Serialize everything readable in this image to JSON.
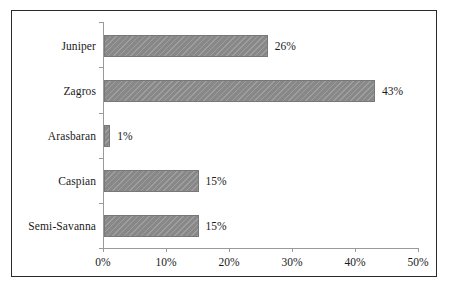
{
  "figure": {
    "background_color": "#ffffff",
    "frame_color": "#2a2a2a",
    "bar_color": "#8d8d8d",
    "axis_color": "#9a9a9a",
    "text_color": "#1a1a1a"
  },
  "chart_data": {
    "type": "bar",
    "orientation": "horizontal",
    "title": "",
    "subtitle": "",
    "xlabel": "",
    "ylabel": "",
    "categories": [
      "Juniper",
      "Zagros",
      "Arasbaran",
      "Caspian",
      "Semi-Savanna"
    ],
    "values": [
      26,
      43,
      1,
      15,
      15
    ],
    "data_labels": [
      "26%",
      "43%",
      "1%",
      "15%",
      "15%"
    ],
    "xlim": [
      0,
      50
    ],
    "xtick_values": [
      0,
      10,
      20,
      30,
      40,
      50
    ],
    "xtick_labels": [
      "0%",
      "10%",
      "20%",
      "30%",
      "40%",
      "50%"
    ],
    "grid": false,
    "legend": false,
    "legend_position": "none",
    "series": [
      {
        "name": "",
        "values": [
          26,
          43,
          1,
          15,
          15
        ]
      }
    ]
  }
}
